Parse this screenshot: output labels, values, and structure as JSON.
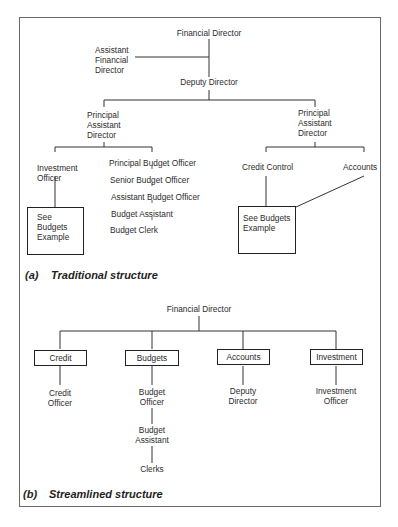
{
  "traditional": {
    "caption_label": "(a)",
    "caption_text": "Traditional structure",
    "financial_director": "Financial Director",
    "assistant_financial_director": [
      "Assistant",
      "Financial",
      "Director"
    ],
    "deputy_director": "Deputy Director",
    "left_pad": [
      "Principal",
      "Assistant",
      "Director"
    ],
    "right_pad": [
      "Principal",
      "Assistant",
      "Director"
    ],
    "investment_officer": [
      "Investment",
      "Officer"
    ],
    "left_box": [
      "See",
      "Budgets",
      "Example"
    ],
    "budget_chain": [
      "Principal Budget Officer",
      "Senior Budget Officer",
      "Assistant Budget Officer",
      "Budget Assistant",
      "Budget Clerk"
    ],
    "credit_control": "Credit Control",
    "accounts": "Accounts",
    "right_box": [
      "See Budgets",
      "Example"
    ]
  },
  "streamlined": {
    "caption_label": "(b)",
    "caption_text": "Streamlined structure",
    "financial_director": "Financial Director",
    "departments": [
      {
        "name": "Credit",
        "sub": [
          "Credit",
          "Officer"
        ]
      },
      {
        "name": "Budgets",
        "sub": [
          "Budget",
          "Officer"
        ]
      },
      {
        "name": "Accounts",
        "sub": [
          "Deputy",
          "Director"
        ]
      },
      {
        "name": "Investment",
        "sub": [
          "Investment",
          "Officer"
        ]
      }
    ],
    "budget_assistant": [
      "Budget",
      "Assistant"
    ],
    "clerks": "Clerks"
  }
}
